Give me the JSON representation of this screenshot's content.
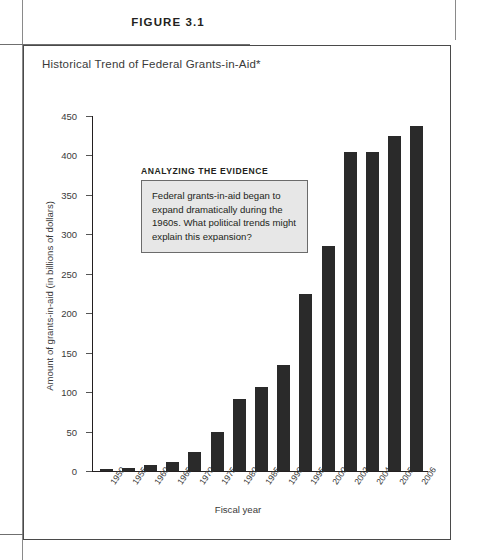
{
  "figure": {
    "label": "FIGURE 3.1",
    "title": "Historical Trend of Federal Grants-in-Aid*"
  },
  "callout": {
    "heading": "ANALYZING THE EVIDENCE",
    "body": "Federal grants-in-aid began to expand dramatically during the 1960s. What political trends might explain this expansion?"
  },
  "chart_data": {
    "type": "bar",
    "title": "Historical Trend of Federal Grants-in-Aid*",
    "xlabel": "Fiscal year",
    "ylabel": "Amount of grants-in-aid (in billions of dollars)",
    "ylim": [
      0,
      450
    ],
    "yticks": [
      0,
      50,
      100,
      150,
      200,
      250,
      300,
      350,
      400,
      450
    ],
    "grid": false,
    "legend": null,
    "bar_color": "#2a2a2a",
    "categories": [
      "1950",
      "1955",
      "1960",
      "1965",
      "1970",
      "1975",
      "1980",
      "1985",
      "1990",
      "1995",
      "2000",
      "2002",
      "2004",
      "2005",
      "2006"
    ],
    "values": [
      2.3,
      3.2,
      7,
      11,
      24,
      50,
      91,
      106,
      135,
      225,
      285,
      405,
      405,
      425,
      437
    ]
  }
}
